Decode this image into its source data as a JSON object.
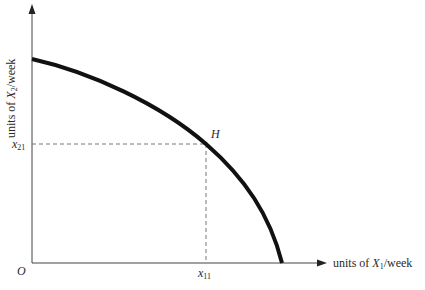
{
  "figure": {
    "type": "production-possibility-frontier",
    "axes": {
      "x_label_prefix": "units of ",
      "x_label_var": "X",
      "x_label_sub": "1",
      "x_label_suffix": "/week",
      "y_label_prefix": "units of ",
      "y_label_var": "X",
      "y_label_sub": "2",
      "y_label_suffix": "/week",
      "origin_label": "O"
    },
    "point": {
      "label": "H",
      "x_tick_var": "x",
      "x_tick_sub": "11",
      "y_tick_var": "x",
      "y_tick_sub": "21"
    },
    "colors": {
      "curve": "#111111",
      "axis": "#444444",
      "guide": "#666666"
    }
  }
}
